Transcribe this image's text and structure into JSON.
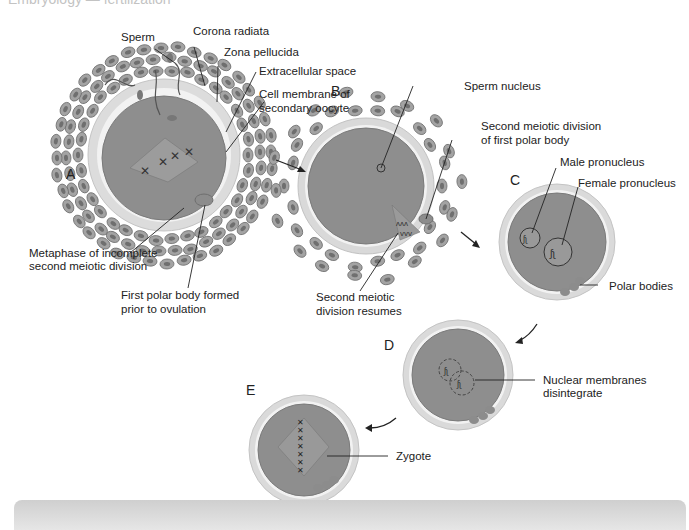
{
  "header": {
    "cut_text": "Embryology — fertilization"
  },
  "stages": {
    "A": "A",
    "B": "B",
    "C": "C",
    "D": "D",
    "E": "E"
  },
  "labels": {
    "sperm": "Sperm",
    "corona_radiata": "Corona radiata",
    "zona_pellucida": "Zona pellucida",
    "extracellular_space": "Extracellular space",
    "cell_membrane_1": "Cell membrane of",
    "cell_membrane_2": "secondary oocyte",
    "metaphase_1": "Metaphase of incomplete",
    "metaphase_2": "second meiotic division",
    "first_polar_1": "First polar body formed",
    "first_polar_2": "prior to ovulation",
    "sperm_nucleus": "Sperm nucleus",
    "second_div_polar_1": "Second meiotic division",
    "second_div_polar_2": "of first polar body",
    "second_div_resumes_1": "Second meiotic",
    "second_div_resumes_2": "division resumes",
    "male_pronucleus": "Male pronucleus",
    "female_pronucleus": "Female pronucleus",
    "polar_bodies": "Polar bodies",
    "nuclear_membranes_1": "Nuclear membranes",
    "nuclear_membranes_2": "disintegrate",
    "zygote": "Zygote"
  },
  "colors": {
    "cytoplasm": "#8f8f8f",
    "zona": "#d9d9d9",
    "corona_cell": "#9a9a9a",
    "line": "#222222"
  }
}
